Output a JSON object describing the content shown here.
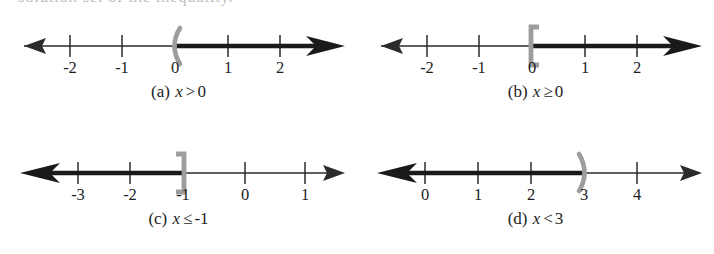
{
  "figure": {
    "kind": "number-line-inequality-figure",
    "clipped_header_text": "solution set of the inequality.",
    "axis_color": "#2b2b2b",
    "ray_color": "#1a1a1a",
    "endpoint_color": "#9a9a9a",
    "label_color": "#1d1d1d",
    "background": "#ffffff"
  },
  "panels": [
    {
      "id": "a",
      "caption_prefix": "(a)",
      "caption_variable": "x",
      "caption_relation": ">",
      "caption_value": "0",
      "caption_full": "(a) x > 0",
      "tick_labels": [
        "-2",
        "-1",
        "0",
        "1",
        "2"
      ],
      "tick_values": [
        -2,
        -1,
        0,
        1,
        2
      ],
      "endpoint_value": 0,
      "endpoint_symbol": "(",
      "endpoint_type": "open",
      "ray_direction": "right",
      "solution": "x > 0"
    },
    {
      "id": "b",
      "caption_prefix": "(b)",
      "caption_variable": "x",
      "caption_relation": "≥",
      "caption_value": "0",
      "caption_full": "(b) x ≥ 0",
      "tick_labels": [
        "-2",
        "-1",
        "0",
        "1",
        "2"
      ],
      "tick_values": [
        -2,
        -1,
        0,
        1,
        2
      ],
      "endpoint_value": 0,
      "endpoint_symbol": "[",
      "endpoint_type": "closed",
      "ray_direction": "right",
      "solution": "x ≥ 0"
    },
    {
      "id": "c",
      "caption_prefix": "(c)",
      "caption_variable": "x",
      "caption_relation": "≤",
      "caption_value": "-1",
      "caption_full": "(c) x ≤ -1",
      "tick_labels": [
        "-3",
        "-2",
        "-1",
        "0",
        "1"
      ],
      "tick_values": [
        -3,
        -2,
        -1,
        0,
        1
      ],
      "endpoint_value": -1,
      "endpoint_symbol": "]",
      "endpoint_type": "closed",
      "ray_direction": "left",
      "solution": "x ≤ -1"
    },
    {
      "id": "d",
      "caption_prefix": "(d)",
      "caption_variable": "x",
      "caption_relation": "<",
      "caption_value": "3",
      "caption_full": "(d) x < 3",
      "tick_labels": [
        "0",
        "1",
        "2",
        "3",
        "4"
      ],
      "tick_values": [
        0,
        1,
        2,
        3,
        4
      ],
      "endpoint_value": 3,
      "endpoint_symbol": ")",
      "endpoint_type": "open",
      "ray_direction": "left",
      "solution": "x < 3"
    }
  ]
}
